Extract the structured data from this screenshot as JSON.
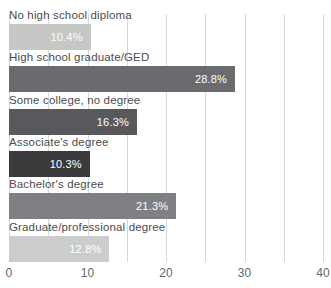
{
  "chart_data": {
    "type": "bar",
    "orientation": "horizontal",
    "title": "",
    "xlabel": "",
    "ylabel": "",
    "categories": [
      "No high school diploma",
      "High school graduate/GED",
      "Some college, no degree",
      "Associate's degree",
      "Bachelor's degree",
      "Graduate/professional degree"
    ],
    "values": [
      10.4,
      28.8,
      16.3,
      10.3,
      21.3,
      12.8
    ],
    "value_labels": [
      "10.4%",
      "28.8%",
      "16.3%",
      "10.3%",
      "21.3%",
      "12.8%"
    ],
    "bar_colors": [
      "#c6c8c5",
      "#6a6b6e",
      "#58595c",
      "#3a3a3c",
      "#7f8083",
      "#cbcccd"
    ],
    "xlim": [
      0,
      40
    ],
    "x_ticks": [
      "0",
      "10",
      "20",
      "30",
      "40"
    ],
    "x_tick_values": [
      0,
      10,
      20,
      30,
      40
    ],
    "gridline_step": 5,
    "grid": true,
    "legend": false,
    "colors": {
      "value_label": "#ffffff",
      "category_label": "#4b4c4e",
      "axis_tick_label": "#66676a",
      "gridline": "#d6d7d9",
      "background": "#ffffff"
    }
  }
}
